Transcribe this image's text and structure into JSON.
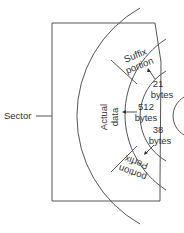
{
  "diagram": {
    "type": "disk-sector-layout",
    "sector_label": "Sector",
    "regions": {
      "suffix": {
        "line1": "Suffix",
        "line2": "portion"
      },
      "actual": {
        "line1": "Actual",
        "line2": "data"
      },
      "prefix": {
        "line1": "Perfix",
        "line2": "portion"
      }
    },
    "sizes": {
      "suffix": {
        "value": "21",
        "unit": "bytes"
      },
      "actual": {
        "value": "512",
        "unit": "bytes"
      },
      "prefix": {
        "value": "38",
        "unit": "bytes"
      }
    },
    "colors": {
      "line": "#555555",
      "text": "#333333",
      "background": "#ffffff"
    }
  }
}
